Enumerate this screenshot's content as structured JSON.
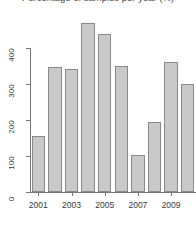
{
  "chart_data": {
    "type": "bar",
    "title": "Percentage of samples per year (%)",
    "xlabel": "",
    "ylabel": "",
    "categories": [
      "2001",
      "2002",
      "2003",
      "2004",
      "2005",
      "2006",
      "2007",
      "2008",
      "2009",
      "2010"
    ],
    "values": [
      155,
      347,
      342,
      470,
      438,
      350,
      103,
      194,
      361,
      300
    ],
    "x_tick_labels": [
      "2001",
      "2003",
      "2005",
      "2007",
      "2009"
    ],
    "x_tick_categories": [
      "2001",
      "2003",
      "2005",
      "2007",
      "2009"
    ],
    "y_tick_labels": [
      "0",
      "100",
      "200",
      "300",
      "400"
    ],
    "y_tick_values": [
      0,
      100,
      200,
      300,
      400
    ],
    "ylim": [
      0,
      470
    ],
    "grid": false,
    "legend": "none",
    "bar_fill_color": "#c9c9c9",
    "bar_border_color": "#8a8a8a",
    "axis_color": "#777777",
    "background_color": "#ffffff"
  }
}
